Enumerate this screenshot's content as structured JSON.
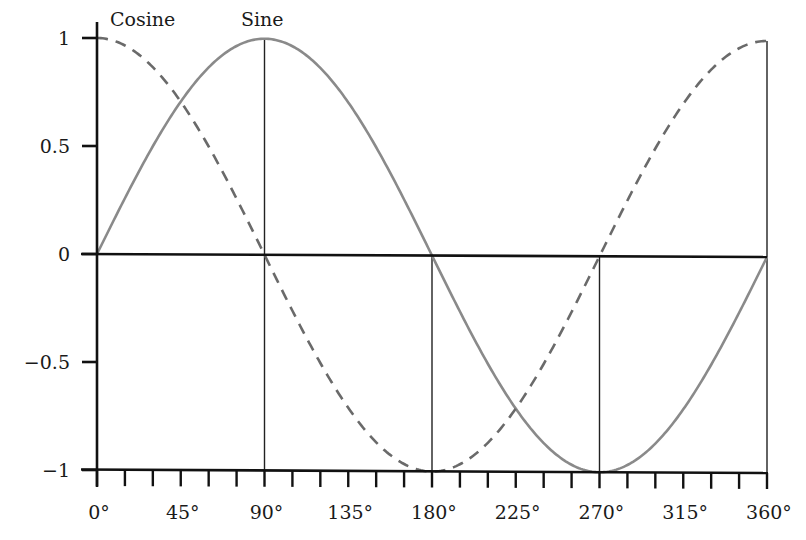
{
  "chart_data": {
    "type": "line",
    "title": "",
    "xlabel": "",
    "ylabel": "",
    "xlim": [
      0,
      360
    ],
    "ylim": [
      -1,
      1
    ],
    "grid": false,
    "legend_position": "inline-top",
    "x_ticks": [
      0,
      45,
      90,
      135,
      180,
      225,
      270,
      315,
      360
    ],
    "x_tick_labels": [
      "0°",
      "45°",
      "90°",
      "135°",
      "180°",
      "225°",
      "270°",
      "315°",
      "360°"
    ],
    "x_minor_tick_step": 15,
    "y_ticks": [
      1,
      0.5,
      0,
      -0.5,
      -1
    ],
    "y_tick_labels": [
      "1",
      "0.5",
      "0",
      "−0.5",
      "−1"
    ],
    "x": [
      0,
      15,
      30,
      45,
      60,
      75,
      90,
      105,
      120,
      135,
      150,
      165,
      180,
      195,
      210,
      225,
      240,
      255,
      270,
      285,
      300,
      315,
      330,
      345,
      360
    ],
    "series": [
      {
        "name": "Sine",
        "style": "solid",
        "color": "#8a8a8a",
        "values": [
          0,
          0.259,
          0.5,
          0.707,
          0.866,
          0.966,
          1,
          0.966,
          0.866,
          0.707,
          0.5,
          0.259,
          0,
          -0.259,
          -0.5,
          -0.707,
          -0.866,
          -0.966,
          -1,
          -0.966,
          -0.866,
          -0.707,
          -0.5,
          -0.259,
          0
        ]
      },
      {
        "name": "Cosine",
        "style": "dashed",
        "color": "#6a6a6a",
        "values": [
          1,
          0.966,
          0.866,
          0.707,
          0.5,
          0.259,
          0,
          -0.259,
          -0.5,
          -0.707,
          -0.866,
          -0.966,
          -1,
          -0.966,
          -0.866,
          -0.707,
          -0.5,
          -0.259,
          0,
          0.259,
          0.5,
          0.707,
          0.866,
          0.966,
          1
        ]
      }
    ],
    "reference_lines": [
      {
        "x": 90,
        "from_y": 1,
        "to_y": -1
      },
      {
        "x": 180,
        "from_y": 0,
        "to_y": -1
      },
      {
        "x": 270,
        "from_y": 0,
        "to_y": -1
      },
      {
        "x": 360,
        "from_y": 1,
        "to_y": -1
      }
    ],
    "annotations": [
      {
        "text": "Cosine",
        "near_x": 0,
        "position": "above-top"
      },
      {
        "text": "Sine",
        "near_x": 90,
        "position": "above-top"
      }
    ]
  },
  "labels": {
    "cosine": "Cosine",
    "sine": "Sine"
  },
  "colors": {
    "axis": "#111111",
    "sine": "#8a8a8a",
    "cosine": "#6a6a6a",
    "reference": "#222222"
  }
}
